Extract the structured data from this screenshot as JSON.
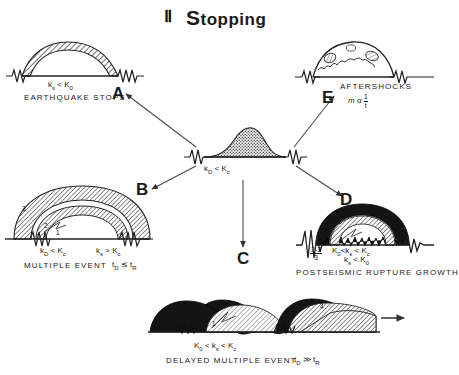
{
  "title": {
    "roman": "Ⅱ",
    "word_first": "S",
    "word_rest": "topping"
  },
  "hub": {
    "equation_pre": "k",
    "equation": "k₀ < Kᴄ",
    "k_sub": "D",
    "rel": "<",
    "K_sub": "c"
  },
  "panels": [
    {
      "id": "A",
      "letter": "A",
      "caption": "EARTHQUAKE STOPS",
      "eq_k": "k",
      "eq_k_sub": "s",
      "eq_rel": "<",
      "eq_K": "K",
      "eq_K_sub": "0",
      "extra": ""
    },
    {
      "id": "B",
      "letter": "B",
      "caption": "MULTIPLE EVENT",
      "eq1_k": "k",
      "eq1_k_sub": "D",
      "eq1_rel": "<",
      "eq1_K": "K",
      "eq1_K_sub": "c",
      "eq2_k": "k",
      "eq2_k_sub": "s",
      "eq2_rel": ">",
      "eq2_K": "K",
      "eq2_K_sub": "c",
      "time_t": "t",
      "time_t_sub": "D",
      "time_rel": "≲",
      "time_t2": "t",
      "time_t2_sub": "R",
      "layer_labels": [
        "1",
        "2",
        "3"
      ]
    },
    {
      "id": "C",
      "letter": "C",
      "caption": "",
      "extra": ""
    },
    {
      "id": "D",
      "letter": "D",
      "caption": "POSTSEISMIC RUPTURE GROWTH",
      "frac_num": "2-3",
      "frac_den": "3",
      "eq1": "K₀ < kₛ < Kᴄ",
      "eq1_K0": "K",
      "eq1_K0_sub": "0",
      "eq1_r1": "<",
      "eq1_ks": "k",
      "eq1_ks_sub": "s",
      "eq1_r2": "<",
      "eq1_Kc": "K",
      "eq1_Kc_sub": "c",
      "eq2_k": "k",
      "eq2_k_sub": "s",
      "eq2_rel": "<",
      "eq2_K": "K",
      "eq2_K_sub": "0",
      "layer_labels": [
        "1",
        "2",
        "3"
      ]
    },
    {
      "id": "E",
      "letter": "E",
      "caption": "AFTERSHOCKS",
      "formula_m": "m",
      "formula_prop": "α",
      "formula_num": "1",
      "formula_den": "t"
    },
    {
      "id": "F",
      "letter": "",
      "caption": "DELAYED MULTIPLE EVENT",
      "eq_K0": "K",
      "eq_K0_sub": "0",
      "eq_r1": "<",
      "eq_ks": "k",
      "eq_ks_sub": "s",
      "eq_r2": "<",
      "eq_Kc": "K",
      "eq_Kc_sub": "c",
      "time_t": "t",
      "time_t_sub": "D",
      "time_rel": "≫",
      "time_t2": "t",
      "time_t2_sub": "R",
      "layer_labels": [
        "1",
        "2",
        "3",
        "4"
      ]
    }
  ],
  "colors": {
    "ink": "#1a1a1a",
    "hatch": "#6b6b6b",
    "dark": "#111111",
    "paper": "#ffffff"
  }
}
